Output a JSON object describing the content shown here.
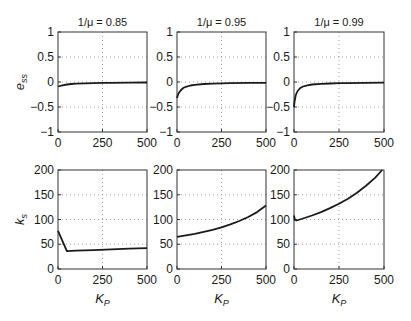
{
  "chart_data": [
    {
      "type": "line",
      "row": 0,
      "col": 0,
      "title": "1/μ = 0.85",
      "xlabel": "",
      "ylabel": "e",
      "ylabel_sub": "ss",
      "xlim": [
        0,
        500
      ],
      "ylim": [
        -1,
        1
      ],
      "xticks": [
        0,
        250,
        500
      ],
      "yticks": [
        -1,
        -0.5,
        0,
        0.5,
        1
      ],
      "ytick_labels": [
        "−1",
        "−0.5",
        "0",
        "0.5",
        "1"
      ],
      "grid": true,
      "x": [
        0,
        10,
        25,
        50,
        75,
        100,
        150,
        200,
        250,
        300,
        400,
        500
      ],
      "y": [
        -0.09,
        -0.08,
        -0.065,
        -0.05,
        -0.04,
        -0.034,
        -0.026,
        -0.021,
        -0.018,
        -0.016,
        -0.013,
        -0.011
      ]
    },
    {
      "type": "line",
      "row": 0,
      "col": 1,
      "title": "1/μ = 0.95",
      "xlabel": "",
      "ylabel": "",
      "xlim": [
        0,
        500
      ],
      "ylim": [
        -1,
        1
      ],
      "xticks": [
        0,
        250,
        500
      ],
      "yticks": [
        -1,
        -0.5,
        0,
        0.5,
        1
      ],
      "ytick_labels": [
        "−1",
        "−0.5",
        "0",
        "0.5",
        "1"
      ],
      "grid": true,
      "x": [
        0,
        5,
        10,
        20,
        35,
        50,
        75,
        100,
        150,
        200,
        250,
        300,
        400,
        500
      ],
      "y": [
        -0.32,
        -0.26,
        -0.22,
        -0.17,
        -0.12,
        -0.095,
        -0.07,
        -0.055,
        -0.04,
        -0.032,
        -0.027,
        -0.023,
        -0.018,
        -0.015
      ]
    },
    {
      "type": "line",
      "row": 0,
      "col": 2,
      "title": "1/μ = 0.99",
      "xlabel": "",
      "ylabel": "",
      "xlim": [
        0,
        500
      ],
      "ylim": [
        -1,
        1
      ],
      "xticks": [
        0,
        250,
        500
      ],
      "yticks": [
        -1,
        -0.5,
        0,
        0.5,
        1
      ],
      "ytick_labels": [
        "−1",
        "−0.5",
        "0",
        "0.5",
        "1"
      ],
      "grid": true,
      "x": [
        0,
        3,
        6,
        10,
        20,
        35,
        50,
        75,
        100,
        150,
        200,
        250,
        300,
        400,
        500
      ],
      "y": [
        -0.5,
        -0.4,
        -0.33,
        -0.26,
        -0.18,
        -0.12,
        -0.09,
        -0.065,
        -0.05,
        -0.036,
        -0.029,
        -0.024,
        -0.021,
        -0.017,
        -0.014
      ]
    },
    {
      "type": "line",
      "row": 1,
      "col": 0,
      "title": "",
      "xlabel": "K",
      "xlabel_sub": "P",
      "ylabel": "k",
      "ylabel_sub": "s",
      "xlim": [
        0,
        500
      ],
      "ylim": [
        0,
        200
      ],
      "xticks": [
        0,
        250,
        500
      ],
      "yticks": [
        0,
        50,
        100,
        150,
        200
      ],
      "ytick_labels": [
        "0",
        "50",
        "100",
        "150",
        "200"
      ],
      "grid": true,
      "x": [
        0,
        50,
        100,
        200,
        300,
        400,
        500
      ],
      "y": [
        77,
        36,
        37,
        38,
        39.5,
        41,
        42
      ]
    },
    {
      "type": "line",
      "row": 1,
      "col": 1,
      "title": "",
      "xlabel": "K",
      "xlabel_sub": "P",
      "ylabel": "",
      "xlim": [
        0,
        500
      ],
      "ylim": [
        0,
        200
      ],
      "xticks": [
        0,
        250,
        500
      ],
      "yticks": [
        0,
        50,
        100,
        150,
        200
      ],
      "ytick_labels": [
        "0",
        "50",
        "100",
        "150",
        "200"
      ],
      "grid": true,
      "x": [
        0,
        50,
        100,
        150,
        200,
        250,
        300,
        350,
        400,
        450,
        500
      ],
      "y": [
        65,
        68,
        71,
        75,
        79,
        84,
        90,
        97,
        105,
        115,
        128
      ]
    },
    {
      "type": "line",
      "row": 1,
      "col": 2,
      "title": "",
      "xlabel": "K",
      "xlabel_sub": "P",
      "ylabel": "",
      "xlim": [
        0,
        500
      ],
      "ylim": [
        0,
        200
      ],
      "xticks": [
        0,
        250,
        500
      ],
      "yticks": [
        0,
        50,
        100,
        150,
        200
      ],
      "ytick_labels": [
        "0",
        "50",
        "100",
        "150",
        "200"
      ],
      "grid": true,
      "x": [
        0,
        5,
        15,
        50,
        100,
        150,
        200,
        250,
        300,
        350,
        400,
        450,
        490
      ],
      "y": [
        108,
        99,
        98,
        102,
        108,
        115,
        123,
        132,
        142,
        154,
        168,
        184,
        200
      ]
    }
  ],
  "layout": {
    "col_left": [
      58,
      177,
      294
    ],
    "col_right": [
      147,
      266,
      384
    ],
    "row_top": [
      32,
      170
    ],
    "row_bottom": [
      132,
      269
    ],
    "line_color": "#1a1a1a",
    "grid_color": "#888888",
    "frame_color": "#333333"
  }
}
